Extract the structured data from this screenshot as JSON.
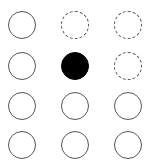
{
  "board": {
    "rows": 4,
    "cols": 3,
    "colors": {
      "stroke": "#555555",
      "filled": "#000000",
      "background": "#ffffff"
    },
    "cells": [
      {
        "row": 0,
        "col": 0,
        "state": "empty",
        "x": 8,
        "y": 11
      },
      {
        "row": 0,
        "col": 1,
        "state": "dashed",
        "x": 61,
        "y": 11
      },
      {
        "row": 0,
        "col": 2,
        "state": "dashed",
        "x": 114,
        "y": 11
      },
      {
        "row": 1,
        "col": 0,
        "state": "empty",
        "x": 8,
        "y": 52
      },
      {
        "row": 1,
        "col": 1,
        "state": "filled",
        "x": 61,
        "y": 52
      },
      {
        "row": 1,
        "col": 2,
        "state": "dashed",
        "x": 114,
        "y": 52
      },
      {
        "row": 2,
        "col": 0,
        "state": "empty",
        "x": 8,
        "y": 92
      },
      {
        "row": 2,
        "col": 1,
        "state": "empty",
        "x": 61,
        "y": 92
      },
      {
        "row": 2,
        "col": 2,
        "state": "empty",
        "x": 114,
        "y": 92
      },
      {
        "row": 3,
        "col": 0,
        "state": "empty",
        "x": 8,
        "y": 131
      },
      {
        "row": 3,
        "col": 1,
        "state": "empty",
        "x": 61,
        "y": 131
      },
      {
        "row": 3,
        "col": 2,
        "state": "empty",
        "x": 114,
        "y": 131
      }
    ]
  }
}
